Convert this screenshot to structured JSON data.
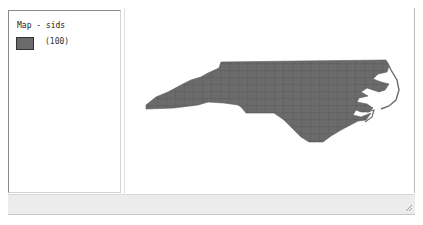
{
  "legend": {
    "title": "Map - sids",
    "items": [
      {
        "label": "(100)",
        "color": "#6b6b6b"
      }
    ]
  },
  "map": {
    "layer": "sids",
    "feature_count": 100,
    "region": "North Carolina counties",
    "fill_color": "#6b6b6b",
    "stroke_color": "#555555"
  },
  "status_bar": {
    "text": ""
  }
}
